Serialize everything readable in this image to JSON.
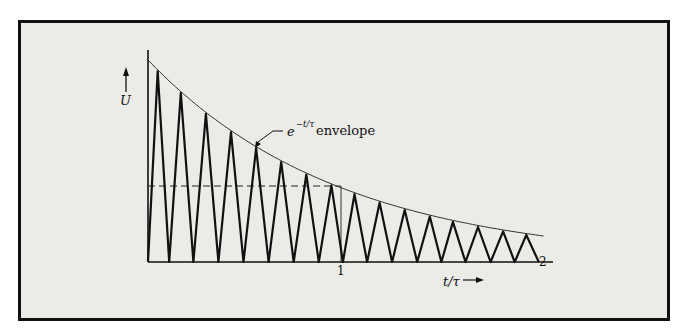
{
  "figure": {
    "y_axis_label": "U",
    "x_axis_label": "t/τ",
    "envelope_label_base": "e",
    "envelope_label_exponent": "−t/τ",
    "envelope_label_text": "envelope",
    "x_ticks": [
      "1",
      "2"
    ]
  },
  "colors": {
    "frame_border": "#111111",
    "panel_background": "#ebebe8",
    "curve": "#111111",
    "envelope": "#333333"
  },
  "chart_data": {
    "type": "line",
    "title": "",
    "xlabel": "t/τ",
    "ylabel": "U",
    "xlim": [
      0,
      2.05
    ],
    "x_ticks": [
      1,
      2
    ],
    "series": [
      {
        "name": "U(t) oscillation",
        "style": "solid thick zigzag",
        "cycles_in_range": 16,
        "peaks_t": [
          0.05,
          0.17,
          0.3,
          0.43,
          0.56,
          0.69,
          0.82,
          0.95,
          1.07,
          1.2,
          1.33,
          1.46,
          1.58,
          1.71,
          1.84,
          1.96
        ]
      },
      {
        "name": "e^{-t/τ} envelope",
        "style": "thin curve",
        "formula": "U0·exp(-t/τ)"
      },
      {
        "name": "1/e level",
        "style": "dashed horizontal",
        "t_range": [
          0,
          1
        ]
      }
    ],
    "annotations": [
      "e^{−t/τ} envelope",
      "vertical marker at t/τ = 1"
    ]
  }
}
